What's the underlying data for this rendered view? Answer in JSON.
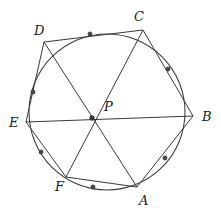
{
  "figure": {
    "kind": "geometry-diagram",
    "width": 221,
    "height": 215,
    "background_color": "#ffffff",
    "line_color": "#3a3a3a",
    "dot_color": "#4a4a4a"
  },
  "circle": {
    "name": "circumscribed-circle",
    "cx": 107,
    "cy": 112,
    "r": 78
  },
  "center_point": {
    "name": "P",
    "label": "P",
    "x": 92,
    "y": 118,
    "label_x": 104,
    "label_y": 100
  },
  "vertices": [
    {
      "name": "A",
      "label": "A",
      "x": 137,
      "y": 187,
      "label_x": 139,
      "label_y": 194
    },
    {
      "name": "B",
      "label": "B",
      "x": 193,
      "y": 116,
      "label_x": 202,
      "label_y": 110
    },
    {
      "name": "C",
      "label": "C",
      "x": 143,
      "y": 30,
      "label_x": 134,
      "label_y": 10
    },
    {
      "name": "D",
      "label": "D",
      "x": 44,
      "y": 42,
      "label_x": 34,
      "label_y": 24
    },
    {
      "name": "E",
      "label": "E",
      "x": 26,
      "y": 122,
      "label_x": 9,
      "label_y": 116
    },
    {
      "name": "F",
      "label": "F",
      "x": 66,
      "y": 177,
      "label_x": 55,
      "label_y": 180
    }
  ],
  "arc_points": [
    {
      "name": "arc-point-dc",
      "x": 90,
      "y": 34
    },
    {
      "name": "arc-point-cb",
      "x": 168,
      "y": 69
    },
    {
      "name": "arc-point-ba",
      "x": 165,
      "y": 158
    },
    {
      "name": "arc-point-af",
      "x": 93,
      "y": 187
    },
    {
      "name": "arc-point-fe",
      "x": 41,
      "y": 152
    },
    {
      "name": "arc-point-ed",
      "x": 33,
      "y": 92
    }
  ],
  "hexagon_edges": [
    {
      "name": "edge-AB",
      "from": "A",
      "to": "B"
    },
    {
      "name": "edge-BC",
      "from": "B",
      "to": "C"
    },
    {
      "name": "edge-CD",
      "from": "C",
      "to": "D"
    },
    {
      "name": "edge-DE",
      "from": "D",
      "to": "E"
    },
    {
      "name": "edge-EF",
      "from": "E",
      "to": "F"
    },
    {
      "name": "edge-FA",
      "from": "F",
      "to": "A"
    }
  ],
  "diagonals": [
    {
      "name": "diagonal-AD",
      "from": "A",
      "to": "D"
    },
    {
      "name": "diagonal-BE",
      "from": "B",
      "to": "E"
    },
    {
      "name": "diagonal-CF",
      "from": "C",
      "to": "F"
    }
  ]
}
